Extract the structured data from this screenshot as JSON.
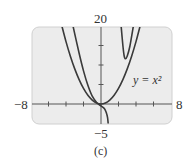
{
  "chart_data": {
    "type": "line",
    "title": "",
    "caption": "(c)",
    "xlabel": "",
    "ylabel": "",
    "xlim": [
      -8,
      8
    ],
    "ylim": [
      -5,
      20
    ],
    "x_tick_step": 2,
    "y_tick_step": 5,
    "grid": false,
    "axis_labels": {
      "xmin": "−8",
      "xmax": "8",
      "ymax": "20",
      "ymin": "−5"
    },
    "annotation": {
      "text": "y = x²",
      "x": 4.8,
      "y": 6
    },
    "series": [
      {
        "name": "y = x²",
        "points": [
          [
            -4.5,
            20.25
          ],
          [
            -4,
            16
          ],
          [
            -3.5,
            12.25
          ],
          [
            -3,
            9
          ],
          [
            -2.5,
            6.25
          ],
          [
            -2,
            4
          ],
          [
            -1.5,
            2.25
          ],
          [
            -1,
            1
          ],
          [
            -0.5,
            0.25
          ],
          [
            0,
            0
          ],
          [
            0.5,
            0.25
          ],
          [
            1,
            1
          ],
          [
            1.5,
            2.25
          ],
          [
            2,
            4
          ],
          [
            2.5,
            6.25
          ],
          [
            3,
            9
          ],
          [
            3.5,
            12.25
          ],
          [
            4,
            16
          ],
          [
            4.5,
            20.25
          ]
        ]
      },
      {
        "name": "curve-left-branch",
        "points": [
          [
            -3.2,
            20
          ],
          [
            -2.5,
            13
          ],
          [
            -2,
            8.5
          ],
          [
            -1.5,
            4.8
          ],
          [
            -1,
            2
          ],
          [
            -0.5,
            0.4
          ],
          [
            0,
            -0.5
          ],
          [
            0.4,
            -1.2
          ],
          [
            0.6,
            -2.2
          ],
          [
            0.75,
            -3.5
          ],
          [
            0.82,
            -5
          ]
        ]
      },
      {
        "name": "curve-right-branch",
        "points": [
          [
            2.3,
            20
          ],
          [
            2.5,
            15
          ],
          [
            2.65,
            12.3
          ],
          [
            2.8,
            11.6
          ],
          [
            3.0,
            12.3
          ],
          [
            3.3,
            14.8
          ],
          [
            3.7,
            20
          ]
        ]
      }
    ],
    "colors": {
      "frame_bg": "#ececec",
      "frame_border": "#d0d0d0",
      "curve": "#3a3a3a",
      "axis": "#555555"
    }
  }
}
